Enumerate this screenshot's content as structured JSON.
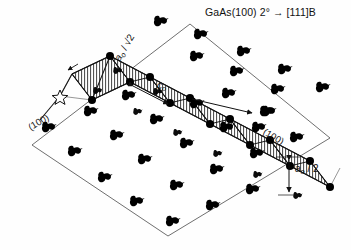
{
  "figure": {
    "domain_type": "scientific-diagram",
    "title": "GaAs(100) 2° → [111]B",
    "description_labels": {
      "step_width_label": "a",
      "step_width_sub": "o",
      "step_width_tail": " / √2",
      "period_label": "c",
      "period_sub": "o",
      "step_height_label": "a",
      "step_height_sub": "o",
      "step_height_tail": " / 2",
      "plane_left": "(100)",
      "plane_right": "(100)"
    },
    "colors": {
      "background": "#ffffff",
      "ink": "#111111",
      "outline": "#3a3a3a",
      "hatch": "#2b2b2b",
      "atom_fill": "#000000",
      "vertex_fill": "#000000"
    },
    "geometry": {
      "base_plane": [
        [
          32,
          145
        ],
        [
          190,
          24
        ],
        [
          330,
          138
        ],
        [
          168,
          236
        ]
      ],
      "terrace_axis_deg": 31,
      "step_count": 6
    },
    "atoms": {
      "glyph_name": "as-dimer-glyph",
      "upper_terrace_rows": [
        [
          [
            160,
            22
          ],
          [
            200,
            35
          ],
          [
            243,
            52
          ],
          [
            284,
            70
          ],
          [
            322,
            88
          ]
        ],
        [
          [
            196,
            57
          ],
          [
            236,
            72
          ],
          [
            277,
            90
          ]
        ],
        [
          [
            228,
            94
          ],
          [
            268,
            112
          ]
        ],
        [
          [
            258,
            128
          ]
        ]
      ],
      "lower_terrace_rows": [
        [
          [
            48,
            128
          ],
          [
            90,
            112
          ],
          [
            128,
            96
          ]
        ],
        [
          [
            74,
            152
          ],
          [
            116,
            136
          ],
          [
            156,
            120
          ],
          [
            196,
            104
          ]
        ],
        [
          [
            104,
            178
          ],
          [
            144,
            160
          ],
          [
            186,
            144
          ],
          [
            226,
            128
          ],
          [
            266,
            112
          ]
        ],
        [
          [
            136,
            202
          ],
          [
            176,
            186
          ],
          [
            216,
            170
          ],
          [
            256,
            154
          ],
          [
            296,
            138
          ]
        ],
        [
          [
            172,
            222
          ],
          [
            212,
            206
          ],
          [
            252,
            190
          ]
        ]
      ],
      "step_face_glyphs": [
        [
          96,
          92
        ],
        [
          118,
          106
        ],
        [
          140,
          120
        ],
        [
          162,
          134
        ],
        [
          184,
          150
        ],
        [
          206,
          164
        ],
        [
          228,
          178
        ],
        [
          250,
          192
        ]
      ]
    },
    "vertices": {
      "upper_edge": [
        [
          106,
          66
        ],
        [
          146,
          86
        ],
        [
          186,
          106
        ],
        [
          226,
          126
        ],
        [
          266,
          146
        ],
        [
          306,
          166
        ]
      ],
      "lower_edge": [
        [
          88,
          92
        ],
        [
          128,
          112
        ],
        [
          168,
          132
        ],
        [
          208,
          152
        ],
        [
          248,
          172
        ],
        [
          288,
          192
        ]
      ]
    }
  }
}
